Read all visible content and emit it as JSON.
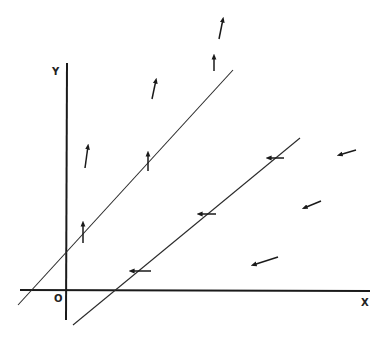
{
  "diagram": {
    "title": "",
    "axes": {
      "x_label": "X",
      "y_label": "Y",
      "origin_label": "O"
    },
    "lines": [
      {
        "name": "upper-line",
        "description": "line with upward vectors"
      },
      {
        "name": "lower-line",
        "description": "line with leftward vectors"
      }
    ],
    "vector_field": {
      "upward_vectors": 6,
      "leftward_vectors": 6
    },
    "colors": {
      "ink": "#1a1a1a",
      "background": "#ffffff"
    }
  }
}
